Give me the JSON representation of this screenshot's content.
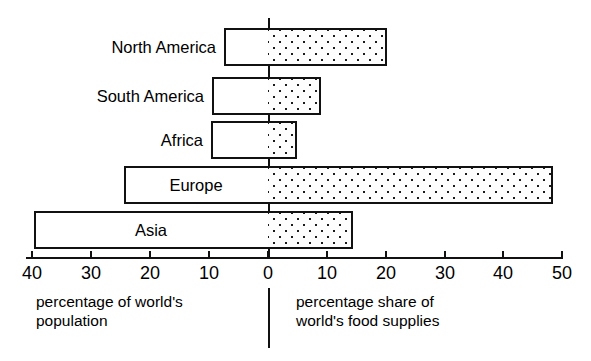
{
  "chart_data": {
    "type": "bar",
    "orientation": "horizontal",
    "style": "back-to-back population pyramid",
    "title": "",
    "subtitle": "",
    "categories": [
      "North America",
      "South America",
      "Africa",
      "Europe",
      "Asia"
    ],
    "series": [
      {
        "name": "percentage of world's population",
        "side": "left",
        "fill": "white",
        "values": [
          7.5,
          9.5,
          10,
          24.5,
          39.5
        ]
      },
      {
        "name": "percentage share of world's food supplies",
        "side": "right",
        "fill": "stippled-dots",
        "values": [
          20,
          9,
          5,
          48.5,
          14.5
        ]
      }
    ],
    "xlabel_left": "percentage of world's population",
    "xlabel_right": "percentage share of world's food supplies",
    "ylabel": "",
    "xlim": [
      -40,
      50
    ],
    "xticks": [
      -40,
      -30,
      -20,
      -10,
      0,
      10,
      20,
      30,
      40,
      50
    ],
    "xtick_labels": [
      "40",
      "30",
      "20",
      "10",
      "0",
      "10",
      "20",
      "30",
      "40",
      "50"
    ],
    "grid": false,
    "legend": "none",
    "colors": {
      "line": "#111111",
      "bar_left_fill": "#ffffff",
      "bar_right_fill": "#fdfdfd",
      "dot": "#1a1a1a",
      "background": "#ffffff"
    }
  },
  "axis": {
    "ticks": [
      {
        "label": "40",
        "x": 32
      },
      {
        "label": "30",
        "x": 91
      },
      {
        "label": "20",
        "x": 150
      },
      {
        "label": "10",
        "x": 209
      },
      {
        "label": "0",
        "x": 268
      },
      {
        "label": "10",
        "x": 327
      },
      {
        "label": "20",
        "x": 386
      },
      {
        "label": "30",
        "x": 445
      },
      {
        "label": "40",
        "x": 503
      },
      {
        "label": "50",
        "x": 562
      }
    ]
  },
  "bars": [
    {
      "category": "North America",
      "label_position": "outside",
      "row_top": 28,
      "pop_value": 7.5,
      "food_value": 20,
      "pop_left": 224,
      "pop_width": 44,
      "food_left": 268,
      "food_width": 119
    },
    {
      "category": "South America",
      "label_position": "outside",
      "row_top": 77,
      "pop_value": 9.5,
      "food_value": 9,
      "pop_left": 212,
      "pop_width": 56,
      "food_left": 268,
      "food_width": 53
    },
    {
      "category": "Africa",
      "label_position": "outside",
      "row_top": 121,
      "pop_value": 10,
      "food_value": 5,
      "pop_left": 211,
      "pop_width": 57,
      "food_left": 268,
      "food_width": 29
    },
    {
      "category": "Europe",
      "label_position": "inside",
      "row_top": 166,
      "pop_value": 24.5,
      "food_value": 48.5,
      "pop_left": 124,
      "pop_width": 144,
      "food_left": 268,
      "food_width": 285
    },
    {
      "category": "Asia",
      "label_position": "inside",
      "row_top": 211,
      "pop_value": 39.5,
      "food_value": 14.5,
      "pop_left": 34,
      "pop_width": 234,
      "food_left": 268,
      "food_width": 85
    }
  ],
  "captions": {
    "left_line1": "percentage of world's",
    "left_line2": "population",
    "right_line1": "percentage share of",
    "right_line2": "world's food supplies"
  }
}
